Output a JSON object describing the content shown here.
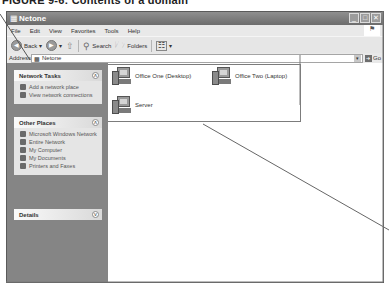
{
  "caption": "FIGURE 9-6: Contents of a domain",
  "window": {
    "title": "Netone",
    "controls": [
      "minimize",
      "maximize",
      "close"
    ]
  },
  "menu": [
    "File",
    "Edit",
    "View",
    "Favorites",
    "Tools",
    "Help"
  ],
  "toolbar": {
    "back": "Back",
    "search": "Search",
    "folders": "Folders"
  },
  "address": {
    "label": "Address",
    "value": "Netone",
    "go": "Go"
  },
  "panels": [
    {
      "title": "Network Tasks",
      "items": [
        "Add a network place",
        "View network connections"
      ]
    },
    {
      "title": "Other Places",
      "items": [
        "Microsoft Windows Network",
        "Entire Network",
        "My Computer",
        "My Documents",
        "Printers and Faxes"
      ]
    },
    {
      "title": "Details",
      "items": []
    }
  ],
  "computers": [
    {
      "label": "Office One (Desktop)"
    },
    {
      "label": "Office Two (Laptop)"
    },
    {
      "label": "Server"
    }
  ]
}
